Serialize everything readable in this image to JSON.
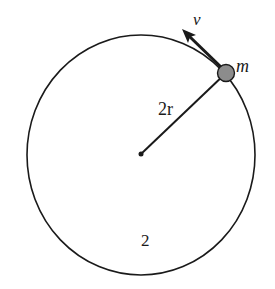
{
  "diagram": {
    "type": "circular-motion",
    "colors": {
      "stroke": "#1a1a1a",
      "mass_fill": "#8c8c8c",
      "background": "#ffffff"
    },
    "circle": {
      "cx": 141,
      "cy": 155,
      "rx": 114,
      "ry": 120
    },
    "center": {
      "x": 141,
      "y": 154
    },
    "mass": {
      "x": 226,
      "y": 73,
      "r": 8
    },
    "velocity_arrow": {
      "from_x": 222,
      "from_y": 68,
      "to_x": 183,
      "to_y": 30
    },
    "labels": {
      "velocity": "v",
      "mass": "m",
      "radius": "2r",
      "region": "2"
    }
  }
}
